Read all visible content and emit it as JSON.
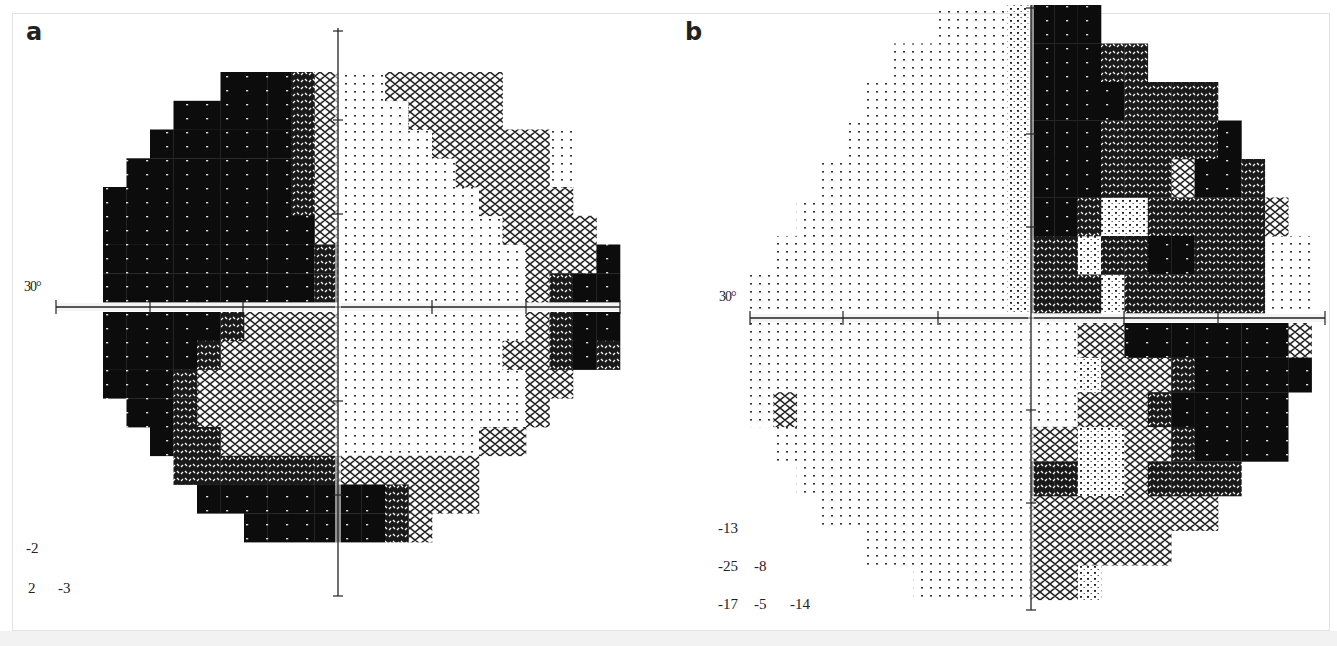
{
  "figure": {
    "panels": [
      {
        "id": "a",
        "label": "a",
        "degree_label": "30°",
        "axis": {
          "cx": 338,
          "cy": 307,
          "h_from": 56,
          "h_to": 620,
          "v_from": 28,
          "v_to": 596,
          "h_ticks": [
            56,
            150,
            243,
            432,
            526,
            620
          ],
          "v_ticks": [
            120,
            214,
            401,
            495,
            596
          ]
        },
        "grid": {
          "x0": 56,
          "cell_w": 23.5,
          "upper_y0": 72,
          "upper_h": 28.75,
          "lower_y0": 312,
          "lower_h": 28.75,
          "upper": [
            ".......444320022222.....",
            ".....44444320002222.....",
            "....444444320000222220..",
            "...4444444320000022220..",
            "..44444444320000002222..",
            "..444444444200000002222.",
            "..444444444300000000222 4",
            "..4444444443000000002344"
          ],
          "lower": [
            "..44444322220000000023 44",
            "..44443222220000000223 43",
            "..4443222222000000002 2..",
            "...443222222000000002...",
            "....4332222200000022....",
            ".....3333333222222......",
            "......444444443222......",
            "........4444443 2......."
          ]
        },
        "threshold_values": [
          [
            "-2"
          ],
          [
            "2",
            "-3"
          ]
        ]
      },
      {
        "id": "b",
        "label": "b",
        "degree_label": "30°",
        "axis": {
          "cx": 1031,
          "cy": 318,
          "h_from": 750,
          "h_to": 1325,
          "v_from": 5,
          "v_to": 610,
          "h_ticks": [
            750,
            843,
            938,
            1124,
            1218,
            1325
          ],
          "v_ticks": [
            134,
            227,
            410,
            503,
            610
          ]
        },
        "grid": {
          "x0": 750,
          "cell_w": 23.4,
          "upper_y0": 5,
          "upper_h": 38.5,
          "lower_y0": 323,
          "lower_h": 34.6,
          "upper": [
            "........0001444.........",
            "......0000014443 3.......",
            ".....000000144443333.....",
            "....0000000144433333 4...",
            "...000000001444333 244 3..",
            "..00000000014431133333 2.",
            ".000000000013313344333 00",
            "00000000000133313333330 0"
          ],
          "lower": [
            "00000000000000224444444 2",
            "000000000000001222344444",
            "02000000000000222344 444",
            ".0000000000022112234444.",
            "..000000000033112333 3..",
            "...00000000022222222....",
            ".....0000000222 222.....",
            ".......00000221........."
          ]
        },
        "threshold_values": [
          [
            "-13"
          ],
          [
            "-25",
            "-8"
          ],
          [
            "-17",
            "-5",
            "-14"
          ]
        ]
      }
    ]
  },
  "chart_data": {
    "type": "heatmap",
    "panels": [
      "a",
      "b"
    ],
    "axis_label": "30°",
    "legend": "Grayscale density: lighter = normal sensitivity, darker = depressed sensitivity (scotoma)",
    "panel_a": {
      "description": "Left hemifield dense defect (upper and lower), arcuate superior nasal band and inferior arcuate defect",
      "threshold_values": [
        [
          "-2"
        ],
        [
          "2",
          "-3"
        ]
      ]
    },
    "panel_b": {
      "description": "Right hemifield dense defect (upper and lower), left hemifield largely normal with small isolated defect",
      "threshold_values": [
        [
          "-13"
        ],
        [
          "-25",
          "-8"
        ],
        [
          "-17",
          "-5",
          "-14"
        ]
      ]
    }
  }
}
